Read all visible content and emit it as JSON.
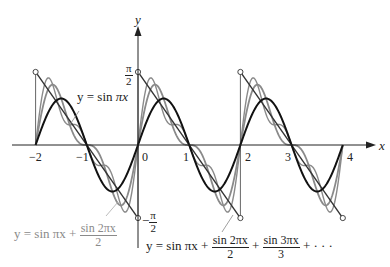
{
  "chart_data": {
    "type": "line",
    "title": "",
    "xlabel": "x",
    "ylabel": "y",
    "xlim": [
      -2,
      4
    ],
    "ylim": [
      -1.5708,
      1.5708
    ],
    "grid": false,
    "x_ticks": [
      "-2",
      "-1",
      "0",
      "1",
      "2",
      "3",
      "4"
    ],
    "y_ticks": [
      "π/2",
      "-π/2"
    ],
    "series": [
      {
        "name": "y = sin πx",
        "terms": 1,
        "color": "#111111",
        "width": 2
      },
      {
        "name": "y = sin πx + sin 2πx / 2",
        "terms": 2,
        "color": "#8a8a8a",
        "width": 1.8
      },
      {
        "name": "y = sin πx + sin 2πx / 2 + sin 3πx / 3 + ...",
        "terms": 3,
        "color": "#8a8a8a",
        "width": 1.4
      },
      {
        "name": "sawtooth limit (π/2)(1 - x) periodic",
        "type": "sawtooth",
        "color": "#333333",
        "width": 1.4,
        "period": 2,
        "amplitude": 1.5708
      }
    ],
    "annotations": [
      "y = sin πx",
      "y = sin πx + (sin 2πx)/2",
      "y = sin πx + (sin 2πx)/2 + (sin 3πx)/3 + ···",
      "π/2",
      "-π/2"
    ]
  },
  "labels": {
    "x_axis": "x",
    "y_axis": "y",
    "tick_m2": "−2",
    "tick_m1": "−1",
    "tick_0": "0",
    "tick_1": "1",
    "tick_2": "2",
    "tick_3": "3",
    "tick_4": "4",
    "pi": "π",
    "two": "2",
    "minus": "−",
    "series1": {
      "lhs": "y = sin ",
      "pix": "πx"
    },
    "series2": {
      "lhs": "y = sin πx + ",
      "num": "sin 2πx",
      "den": "2"
    },
    "series3": {
      "lhs": "y = sin πx + ",
      "num1": "sin 2πx",
      "den1": "2",
      "plus": " + ",
      "num2": "sin 3πx",
      "den2": "3",
      "tail": " + · · ·"
    }
  }
}
